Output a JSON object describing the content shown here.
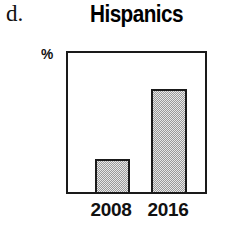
{
  "panel": {
    "letter": "d."
  },
  "chart_data": {
    "type": "bar",
    "title": "Hispanics",
    "xlabel": "",
    "ylabel": "%",
    "categories": [
      "2008",
      "2016"
    ],
    "values": [
      24,
      74
    ],
    "ylim": [
      0,
      100
    ],
    "grid": false,
    "legend": false,
    "bar_fill_color": "#cfcfcf",
    "bar_edge_color": "#1a1a1a",
    "frame_color": "#1a1a1a",
    "background_color": "#ffffff"
  }
}
